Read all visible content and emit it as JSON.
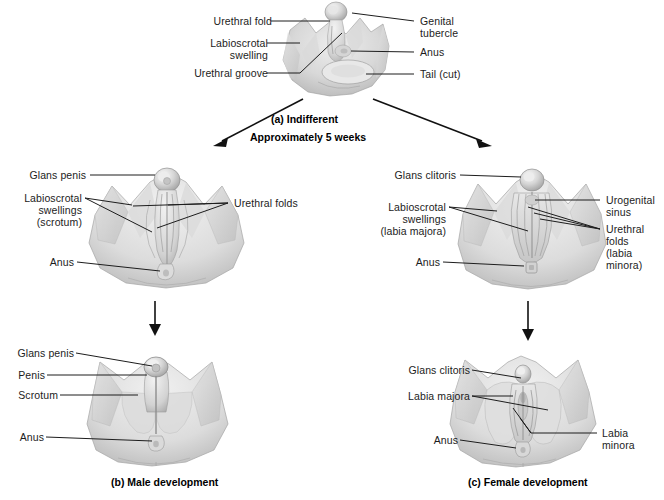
{
  "figure": {
    "title_a": "(a) Indifferent",
    "subtitle_a": "Approximately 5 weeks",
    "caption_b": "(b) Male development",
    "caption_c": "(c) Female development",
    "colors": {
      "background": "#ffffff",
      "text": "#1c1c1c",
      "leader_line": "#1d1d1d",
      "tissue_light": "#e9e9e9",
      "tissue_mid": "#cfcfcf",
      "tissue_dark": "#a8a8a8"
    }
  },
  "panels": {
    "indifferent": {
      "name": "(a) Indifferent",
      "labels_left": [
        {
          "text": "Urethral fold"
        },
        {
          "text": "Labioscrotal\nswelling"
        },
        {
          "text": "Urethral groove"
        }
      ],
      "labels_right": [
        {
          "text": "Genital\ntubercle"
        },
        {
          "text": "Anus"
        },
        {
          "text": "Tail (cut)"
        }
      ]
    },
    "male_mid": {
      "labels_left": [
        {
          "text": "Glans penis"
        },
        {
          "text": "Labioscrotal\nswellings\n(scrotum)"
        },
        {
          "text": "Anus"
        }
      ],
      "labels_right": [
        {
          "text": "Urethral folds"
        }
      ]
    },
    "female_mid": {
      "labels_left": [
        {
          "text": "Glans clitoris"
        },
        {
          "text": "Labioscrotal\nswellings\n(labia majora)"
        },
        {
          "text": "Anus"
        }
      ],
      "labels_right": [
        {
          "text": "Urogenital\nsinus"
        },
        {
          "text": "Urethral\nfolds\n(labia\nminora)"
        }
      ]
    },
    "male_final": {
      "caption": "(b) Male development",
      "labels_left": [
        {
          "text": "Glans penis"
        },
        {
          "text": "Penis"
        },
        {
          "text": "Scrotum"
        },
        {
          "text": "Anus"
        }
      ]
    },
    "female_final": {
      "caption": "(c) Female development",
      "labels_left": [
        {
          "text": "Glans clitoris"
        },
        {
          "text": "Labia majora"
        },
        {
          "text": "Anus"
        }
      ],
      "labels_right": [
        {
          "text": "Labia\nminora"
        }
      ]
    }
  }
}
